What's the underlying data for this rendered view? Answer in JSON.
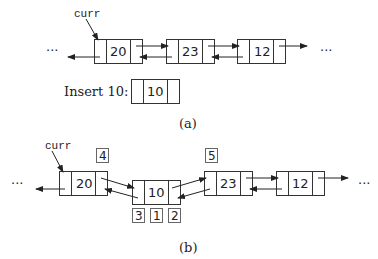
{
  "figure_a": {
    "caption": "(a)",
    "pointer_label": "curr",
    "ellipsis_left": "···",
    "ellipsis_right": "···",
    "nodes": [
      {
        "value": "20",
        "x": 94,
        "y": 39
      },
      {
        "value": "23",
        "x": 166,
        "y": 39
      },
      {
        "value": "12",
        "x": 237,
        "y": 39
      }
    ],
    "insert_label": "Insert 10:",
    "insert_node": {
      "value": "10",
      "x": 131,
      "y": 79
    }
  },
  "figure_b": {
    "caption": "(b)",
    "pointer_label": "curr",
    "ellipsis_left": "···",
    "ellipsis_right": "···",
    "nodes": [
      {
        "value": "20",
        "x": 59,
        "y": 171
      },
      {
        "value": "10",
        "x": 132,
        "y": 180
      },
      {
        "value": "23",
        "x": 204,
        "y": 171
      },
      {
        "value": "12",
        "x": 276,
        "y": 171
      }
    ],
    "step_labels": [
      {
        "label": "4",
        "x": 96,
        "y": 148
      },
      {
        "label": "5",
        "x": 205,
        "y": 148
      },
      {
        "label": "3",
        "x": 132,
        "y": 208
      },
      {
        "label": "1",
        "x": 150,
        "y": 208
      },
      {
        "label": "2",
        "x": 168,
        "y": 208
      }
    ]
  },
  "colors": {
    "stroke": "#333333",
    "text": "#222222",
    "background": "#ffffff"
  }
}
